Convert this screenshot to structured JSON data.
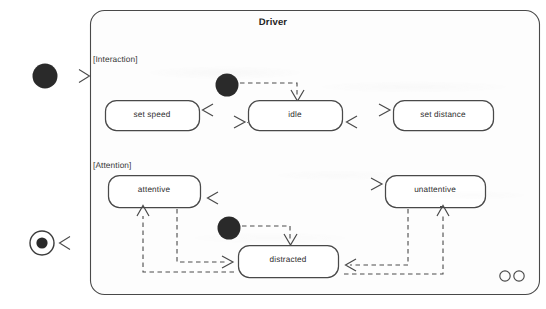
{
  "diagram": {
    "kind": "uml-state-machine",
    "frame_title": "Driver",
    "colors": {
      "background": "#ffffff",
      "frame_fill": "#fdfdfd",
      "stroke": "#4a4a4a",
      "text": "#2b2b2b",
      "node_fill": "#ffffff",
      "pseudostate_fill": "#2b2b2b"
    },
    "regions": [
      {
        "id": "interaction",
        "label": "[Interaction]"
      },
      {
        "id": "attention",
        "label": "[Attention]"
      }
    ],
    "states": [
      {
        "id": "set-speed",
        "label": "set speed",
        "region": "interaction"
      },
      {
        "id": "idle",
        "label": "idle",
        "region": "interaction"
      },
      {
        "id": "set-distance",
        "label": "set distance",
        "region": "interaction"
      },
      {
        "id": "attentive",
        "label": "attentive",
        "region": "attention"
      },
      {
        "id": "unattentive",
        "label": "unattentive",
        "region": "attention"
      },
      {
        "id": "distracted",
        "label": "distracted",
        "region": "attention"
      }
    ],
    "pseudostates": [
      {
        "id": "initial-outer",
        "kind": "initial",
        "placement": "outside-left-top"
      },
      {
        "id": "final-outer",
        "kind": "final",
        "placement": "outside-left-bottom"
      },
      {
        "id": "initial-interaction",
        "kind": "initial",
        "region": "interaction"
      },
      {
        "id": "initial-attention",
        "kind": "initial",
        "region": "attention"
      }
    ],
    "transitions": [
      {
        "from": "initial-outer",
        "to": "Driver",
        "label": ""
      },
      {
        "from": "Driver",
        "to": "final-outer",
        "label": ""
      },
      {
        "from": "initial-interaction",
        "to": "idle",
        "label": ""
      },
      {
        "from": "idle",
        "to": "set-speed",
        "label": ""
      },
      {
        "from": "set-speed",
        "to": "idle",
        "label": ""
      },
      {
        "from": "idle",
        "to": "set-distance",
        "label": ""
      },
      {
        "from": "set-distance",
        "to": "idle",
        "label": ""
      },
      {
        "from": "initial-attention",
        "to": "distracted",
        "label": ""
      },
      {
        "from": "attentive",
        "to": "unattentive",
        "label": ""
      },
      {
        "from": "unattentive",
        "to": "attentive",
        "label": ""
      },
      {
        "from": "attentive",
        "to": "distracted",
        "label": ""
      },
      {
        "from": "distracted",
        "to": "attentive",
        "label": ""
      },
      {
        "from": "unattentive",
        "to": "distracted",
        "label": ""
      },
      {
        "from": "distracted",
        "to": "unattentive",
        "label": ""
      }
    ],
    "corner_marker": {
      "id": "concurrency-marker",
      "glyph": "oo"
    }
  }
}
